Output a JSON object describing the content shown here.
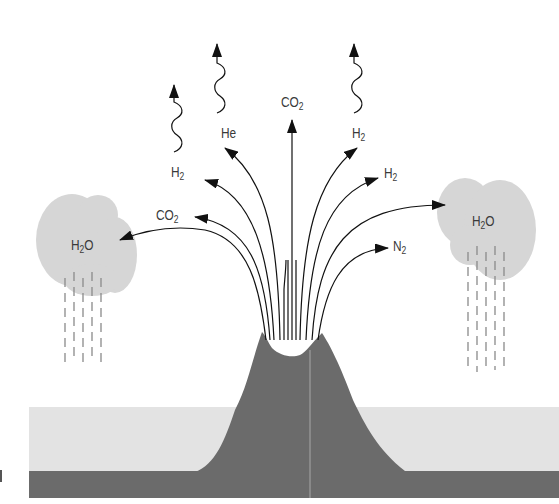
{
  "diagram": {
    "colors": {
      "background": "#ffffff",
      "volcano": "#6e6e6e",
      "sea_floor": "#6e6e6e",
      "ocean": "#e2e2e2",
      "cloud": "#d4d4d4",
      "rain": "#8a8a8a",
      "arrow": "#111111",
      "label": "#3a3a3a"
    },
    "gas_labels": [
      {
        "id": "he",
        "base": "He",
        "sub": "",
        "x": 221,
        "y": 126
      },
      {
        "id": "h2-upper-left",
        "base": "H",
        "sub": "2",
        "x": 171,
        "y": 165
      },
      {
        "id": "co2-left",
        "base": "CO",
        "sub": "2",
        "x": 156,
        "y": 208
      },
      {
        "id": "co2-top",
        "base": "CO",
        "sub": "2",
        "x": 281,
        "y": 95
      },
      {
        "id": "h2-upper-right",
        "base": "H",
        "sub": "2",
        "x": 352,
        "y": 126
      },
      {
        "id": "h2-right",
        "base": "H",
        "sub": "2",
        "x": 384,
        "y": 166
      },
      {
        "id": "n2",
        "base": "N",
        "sub": "2",
        "x": 393,
        "y": 239
      }
    ],
    "clouds": [
      {
        "id": "cloud-left",
        "base": "H",
        "sub": "2",
        "tail": "O",
        "x": 71,
        "y": 238
      },
      {
        "id": "cloud-right",
        "base": "H",
        "sub": "2",
        "tail": "O",
        "x": 472,
        "y": 214
      }
    ],
    "escaping_gases": [
      {
        "id": "escape-h2",
        "note": "H2 escaping to space"
      },
      {
        "id": "escape-he",
        "note": "He escaping to space"
      },
      {
        "id": "escape-h2-right",
        "note": "H2 escaping to space"
      }
    ]
  }
}
